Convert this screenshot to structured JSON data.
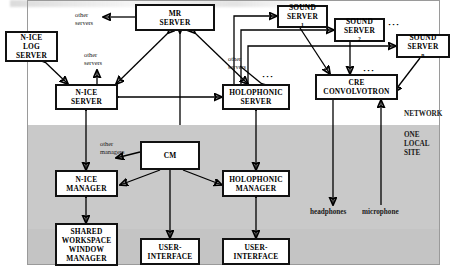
{
  "figure": {
    "region_labels": {
      "network": "NETWORK",
      "local_site_line1": "ONE",
      "local_site_line2": "LOCAL",
      "local_site_line3": "SITE"
    }
  },
  "nodes": [
    {
      "id": "mr-server",
      "lines": [
        "MR",
        "SERVER"
      ]
    },
    {
      "id": "nice-log-server",
      "lines": [
        "N-ICE",
        "LOG",
        "SERVER"
      ]
    },
    {
      "id": "nice-server",
      "lines": [
        "N-ICE",
        "SERVER"
      ]
    },
    {
      "id": "holophonic-server",
      "lines": [
        "HOLOPHONIC",
        "SERVER"
      ]
    },
    {
      "id": "sound-server-1",
      "lines": [
        "SOUND",
        "SERVER"
      ],
      "subscript": "1"
    },
    {
      "id": "sound-server-2",
      "lines": [
        "SOUND",
        "SERVER"
      ],
      "subscript": "2"
    },
    {
      "id": "sound-server-n",
      "lines": [
        "SOUND",
        "SERVER"
      ],
      "subscript": "n"
    },
    {
      "id": "cre-convolvotron",
      "lines": [
        "CRE",
        "CONVOLVOTRON"
      ]
    },
    {
      "id": "cm",
      "lines": [
        "CM"
      ]
    },
    {
      "id": "nice-manager",
      "lines": [
        "N-ICE",
        "MANAGER"
      ]
    },
    {
      "id": "holophonic-manager",
      "lines": [
        "HOLOPHONIC",
        "MANAGER"
      ]
    },
    {
      "id": "shared-workspace-window-manager",
      "lines": [
        "SHARED",
        "WORKSPACE",
        "WINDOW",
        "MANAGER"
      ]
    },
    {
      "id": "user-interface-1",
      "lines": [
        "USER-",
        "INTERFACE"
      ]
    },
    {
      "id": "user-interface-2",
      "lines": [
        "USER-",
        "INTERFACE"
      ]
    }
  ],
  "node_text": {
    "mr_server_l1": "MR",
    "mr_server_l2": "SERVER",
    "nice_log_l1": "N-ICE",
    "nice_log_l2": "LOG",
    "nice_log_l3": "SERVER",
    "nice_server_l1": "N-ICE",
    "nice_server_l2": "SERVER",
    "holophonic_server_l1": "HOLOPHONIC",
    "holophonic_server_l2": "SERVER",
    "sound_l1": "SOUND",
    "sound_l2": "SERVER",
    "sound_sub_1": "1",
    "sound_sub_2": "2",
    "sound_sub_n": "n",
    "cre_l1": "CRE",
    "cre_l2": "CONVOLVOTRON",
    "cm": "CM",
    "nice_manager_l1": "N-ICE",
    "nice_manager_l2": "MANAGER",
    "holophonic_manager_l1": "HOLOPHONIC",
    "holophonic_manager_l2": "MANAGER",
    "sww_l1": "SHARED",
    "sww_l2": "WORKSPACE",
    "sww_l3": "WINDOW",
    "sww_l4": "MANAGER",
    "ui_l1": "USER-",
    "ui_l2": "INTERFACE"
  },
  "annotations": {
    "other_servers_top_l1": "other",
    "other_servers_top_l2": "servers",
    "other_servers_mid_l1": "other",
    "other_servers_mid_l2": "servers",
    "other_servers_right_l1": "other",
    "other_servers_right_l2": "servers",
    "other_managers_l1": "other",
    "other_managers_l2": "managers",
    "headphones": "headphones",
    "microphone": "microphone",
    "ellipsis_sound_servers": "···",
    "ellipsis_cre": "···",
    "ellipsis_holophonic": "···"
  },
  "colors": {
    "stroke": "#000000",
    "box_fill": "#ffffff",
    "local_site_fill": "#c9c9c9",
    "page_fill": "#ffffff"
  }
}
